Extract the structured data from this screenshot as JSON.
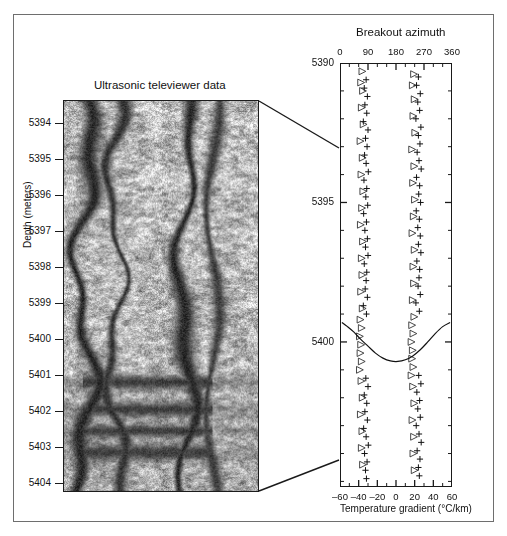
{
  "figure": {
    "background": "#ffffff",
    "frame_color": "#6e6e6e",
    "axis_color": "#1a1a1a"
  },
  "left_panel": {
    "title": "Ultrasonic televiewer data",
    "axis_label": "Depth (meters)",
    "depth_ticks": [
      5394,
      5395,
      5396,
      5397,
      5398,
      5399,
      5400,
      5401,
      5402,
      5403,
      5404
    ],
    "depth_top": 5393.35,
    "depth_bottom": 5404.25,
    "image_description": "grayscale acoustic borehole image with dark vertical breakout bands"
  },
  "right_panel": {
    "title": "Breakout azimuth",
    "xlabel_bottom": "Temperature gradient (°C/km)",
    "azimuth_ticks": [
      0,
      90,
      180,
      270,
      360
    ],
    "azimuth_minor_step": 30,
    "azimuth_range": [
      0,
      360
    ],
    "gradient_ticks": [
      -60,
      -40,
      -20,
      0,
      20,
      40,
      60
    ],
    "gradient_range": [
      -60,
      60
    ],
    "depth_range": [
      5390,
      5405.2
    ],
    "depth_ticks_major": [
      5390,
      5395,
      5400
    ],
    "depth_minor_step": 1,
    "symbols": {
      "plus": "breakout-azimuth-plus",
      "triangle": "breakout-azimuth-triangle"
    }
  },
  "chart_data": {
    "type": "scatter",
    "title": "Breakout azimuth",
    "xlabel": "Temperature gradient (°C/km)",
    "ylabel": "Depth (meters)",
    "xlim": [
      0,
      360
    ],
    "xlim_secondary": [
      -60,
      60
    ],
    "ylim": [
      5405.2,
      5390
    ],
    "grid": false,
    "legend": "none",
    "xticks": [
      0,
      90,
      180,
      270,
      360
    ],
    "xticks_secondary": [
      -60,
      -40,
      -20,
      0,
      20,
      40,
      60
    ],
    "yticks": [
      5390,
      5395,
      5400
    ],
    "series": [
      {
        "name": "Breakout azimuth (plus)",
        "marker": "plus",
        "points": [
          [
            84,
            5390.6
          ],
          [
            78,
            5390.9
          ],
          [
            88,
            5391.2
          ],
          [
            80,
            5391.5
          ],
          [
            86,
            5391.8
          ],
          [
            75,
            5392.1
          ],
          [
            90,
            5392.4
          ],
          [
            82,
            5392.7
          ],
          [
            87,
            5393.0
          ],
          [
            79,
            5393.3
          ],
          [
            84,
            5393.6
          ],
          [
            91,
            5393.9
          ],
          [
            77,
            5394.2
          ],
          [
            86,
            5394.5
          ],
          [
            83,
            5394.8
          ],
          [
            89,
            5395.1
          ],
          [
            76,
            5395.4
          ],
          [
            85,
            5395.7
          ],
          [
            80,
            5396.0
          ],
          [
            88,
            5396.3
          ],
          [
            82,
            5396.6
          ],
          [
            90,
            5396.9
          ],
          [
            78,
            5397.2
          ],
          [
            86,
            5397.5
          ],
          [
            84,
            5397.8
          ],
          [
            81,
            5398.1
          ],
          [
            88,
            5398.4
          ],
          [
            75,
            5398.7
          ],
          [
            85,
            5399.0
          ],
          [
            83,
            5401.3
          ],
          [
            90,
            5401.6
          ],
          [
            78,
            5401.9
          ],
          [
            86,
            5402.2
          ],
          [
            80,
            5402.5
          ],
          [
            88,
            5402.8
          ],
          [
            76,
            5403.1
          ],
          [
            84,
            5403.4
          ],
          [
            91,
            5403.7
          ],
          [
            79,
            5404.0
          ],
          [
            87,
            5404.3
          ],
          [
            82,
            5404.6
          ],
          [
            85,
            5404.9
          ],
          [
            252,
            5390.5
          ],
          [
            246,
            5390.8
          ],
          [
            258,
            5391.1
          ],
          [
            250,
            5391.4
          ],
          [
            256,
            5391.7
          ],
          [
            244,
            5392.0
          ],
          [
            260,
            5392.3
          ],
          [
            252,
            5392.6
          ],
          [
            257,
            5392.9
          ],
          [
            248,
            5393.2
          ],
          [
            254,
            5393.5
          ],
          [
            261,
            5393.8
          ],
          [
            246,
            5394.1
          ],
          [
            256,
            5394.4
          ],
          [
            253,
            5394.7
          ],
          [
            259,
            5395.0
          ],
          [
            245,
            5395.3
          ],
          [
            255,
            5395.6
          ],
          [
            250,
            5395.9
          ],
          [
            258,
            5396.2
          ],
          [
            252,
            5396.5
          ],
          [
            260,
            5396.8
          ],
          [
            247,
            5397.1
          ],
          [
            256,
            5397.4
          ],
          [
            254,
            5397.7
          ],
          [
            251,
            5398.0
          ],
          [
            258,
            5398.3
          ],
          [
            244,
            5398.6
          ],
          [
            255,
            5398.9
          ],
          [
            253,
            5401.2
          ],
          [
            260,
            5401.5
          ],
          [
            247,
            5401.8
          ],
          [
            256,
            5402.1
          ],
          [
            250,
            5402.4
          ],
          [
            258,
            5402.7
          ],
          [
            245,
            5403.0
          ],
          [
            254,
            5403.3
          ],
          [
            261,
            5403.6
          ],
          [
            248,
            5403.9
          ],
          [
            257,
            5404.2
          ],
          [
            252,
            5404.5
          ],
          [
            255,
            5404.8
          ]
        ]
      },
      {
        "name": "Breakout azimuth (triangle)",
        "marker": "triangle",
        "points": [
          [
            72,
            5390.3
          ],
          [
            68,
            5390.7
          ],
          [
            74,
            5391.0
          ],
          [
            70,
            5391.6
          ],
          [
            76,
            5392.2
          ],
          [
            66,
            5392.8
          ],
          [
            73,
            5393.4
          ],
          [
            69,
            5394.0
          ],
          [
            75,
            5394.6
          ],
          [
            71,
            5395.2
          ],
          [
            67,
            5395.8
          ],
          [
            74,
            5396.4
          ],
          [
            70,
            5397.0
          ],
          [
            72,
            5397.6
          ],
          [
            68,
            5398.2
          ],
          [
            73,
            5398.8
          ],
          [
            66,
            5399.2
          ],
          [
            70,
            5399.5
          ],
          [
            64,
            5399.8
          ],
          [
            68,
            5400.1
          ],
          [
            66,
            5400.4
          ],
          [
            70,
            5400.7
          ],
          [
            64,
            5401.0
          ],
          [
            69,
            5401.4
          ],
          [
            73,
            5402.0
          ],
          [
            67,
            5402.6
          ],
          [
            72,
            5403.2
          ],
          [
            70,
            5403.8
          ],
          [
            74,
            5404.4
          ],
          [
            238,
            5390.4
          ],
          [
            234,
            5390.8
          ],
          [
            240,
            5391.3
          ],
          [
            236,
            5391.9
          ],
          [
            242,
            5392.5
          ],
          [
            232,
            5393.1
          ],
          [
            239,
            5393.7
          ],
          [
            235,
            5394.3
          ],
          [
            241,
            5394.9
          ],
          [
            237,
            5395.5
          ],
          [
            233,
            5396.1
          ],
          [
            240,
            5396.7
          ],
          [
            236,
            5397.3
          ],
          [
            238,
            5397.9
          ],
          [
            234,
            5398.5
          ],
          [
            239,
            5399.1
          ],
          [
            232,
            5399.4
          ],
          [
            236,
            5399.7
          ],
          [
            230,
            5400.0
          ],
          [
            234,
            5400.3
          ],
          [
            232,
            5400.6
          ],
          [
            236,
            5400.9
          ],
          [
            230,
            5401.2
          ],
          [
            235,
            5401.6
          ],
          [
            239,
            5402.2
          ],
          [
            233,
            5402.8
          ],
          [
            238,
            5403.4
          ],
          [
            236,
            5404.0
          ],
          [
            240,
            5404.6
          ]
        ]
      },
      {
        "name": "Temperature gradient",
        "marker": "line",
        "axis": "secondary",
        "points": [
          [
            -58,
            5399.3
          ],
          [
            -52,
            5399.45
          ],
          [
            -45,
            5399.65
          ],
          [
            -38,
            5399.9
          ],
          [
            -30,
            5400.15
          ],
          [
            -22,
            5400.4
          ],
          [
            -14,
            5400.58
          ],
          [
            -6,
            5400.68
          ],
          [
            2,
            5400.7
          ],
          [
            10,
            5400.64
          ],
          [
            18,
            5400.5
          ],
          [
            26,
            5400.28
          ],
          [
            34,
            5400.0
          ],
          [
            42,
            5399.7
          ],
          [
            50,
            5399.45
          ],
          [
            58,
            5399.3
          ]
        ]
      }
    ]
  }
}
